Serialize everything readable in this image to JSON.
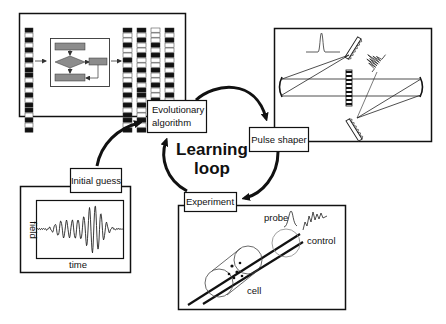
{
  "diagram": {
    "center_label": {
      "line1": "Learning",
      "line2": "loop"
    },
    "nodes": [
      {
        "id": "evolutionary_algorithm",
        "label_line1": "Evolutionary",
        "label_line2": "algorithm"
      },
      {
        "id": "pulse_shaper",
        "label": "Pulse shaper"
      },
      {
        "id": "experiment",
        "label": "Experiment"
      },
      {
        "id": "initial_guess",
        "label": "Initial guess"
      }
    ],
    "edges": [
      {
        "from": "initial_guess",
        "to": "evolutionary_algorithm"
      },
      {
        "from": "evolutionary_algorithm",
        "to": "pulse_shaper"
      },
      {
        "from": "pulse_shaper",
        "to": "experiment"
      },
      {
        "from": "experiment",
        "to": "evolutionary_algorithm"
      }
    ],
    "panels": {
      "initial_guess_plot": {
        "xlabel": "time",
        "ylabel": "field"
      },
      "experiment_scene": {
        "labels": {
          "probe": "probe",
          "control": "control",
          "cell": "cell"
        }
      }
    },
    "colors": {
      "line": "#111111",
      "flow_box": "#8c8c8c",
      "background": "#ffffff"
    }
  }
}
